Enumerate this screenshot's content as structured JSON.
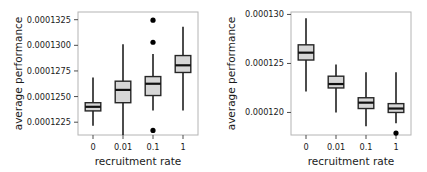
{
  "figure": {
    "title": "",
    "panel_count": 2
  },
  "chart_data": [
    {
      "type": "box",
      "panel_id": "left",
      "panel_label": "left-panel",
      "title": "",
      "xlabel": "recruitment rate",
      "ylabel": "average performance",
      "categories": [
        "0",
        "0.01",
        "0.1",
        "1"
      ],
      "ylim": [
        0.00012125,
        0.00013325
      ],
      "yticks": [
        0.0001225,
        0.000125,
        0.0001275,
        0.00013,
        0.0001325
      ],
      "ytick_labels": [
        "0.0001225",
        "0.0001250",
        "0.0001275",
        "0.0001300",
        "0.0001325"
      ],
      "grid": false,
      "legend": null,
      "boxes": [
        {
          "category": "0",
          "whisker_low": 0.00012215,
          "q1": 0.0001236,
          "median": 0.000124,
          "q3": 0.0001244,
          "whisker_high": 0.00012685,
          "outliers": []
        },
        {
          "category": "0.01",
          "whisker_low": 0.00012125,
          "q1": 0.0001244,
          "median": 0.00012565,
          "q3": 0.0001265,
          "whisker_high": 0.0001301,
          "outliers": []
        },
        {
          "category": "0.1",
          "whisker_low": 0.00012365,
          "q1": 0.0001251,
          "median": 0.00012625,
          "q3": 0.00012695,
          "whisker_high": 0.00012915,
          "outliers": [
            0.00013245,
            0.0001303,
            0.0001217
          ]
        },
        {
          "category": "1",
          "whisker_low": 0.00012365,
          "q1": 0.00012735,
          "median": 0.00012805,
          "q3": 0.000129,
          "whisker_high": 0.0001318,
          "outliers": []
        }
      ]
    },
    {
      "type": "box",
      "panel_id": "right",
      "panel_label": "right-panel",
      "title": "",
      "xlabel": "recruitment rate",
      "ylabel": "average performance",
      "categories": [
        "0",
        "0.01",
        "0.1",
        "1"
      ],
      "ylim": [
        0.0001177,
        0.00013025
      ],
      "yticks": [
        0.00012,
        0.000125,
        0.00013
      ],
      "ytick_labels": [
        "0.000120",
        "0.000125",
        "0.000130"
      ],
      "grid": false,
      "legend": null,
      "boxes": [
        {
          "category": "0",
          "whisker_low": 0.00012215,
          "q1": 0.00012535,
          "median": 0.0001261,
          "q3": 0.0001269,
          "whisker_high": 0.0001296,
          "outliers": []
        },
        {
          "category": "0.01",
          "whisker_low": 0.00012,
          "q1": 0.0001225,
          "median": 0.0001229,
          "q3": 0.0001237,
          "whisker_high": 0.0001249,
          "outliers": []
        },
        {
          "category": "0.1",
          "whisker_low": 0.0001186,
          "q1": 0.0001204,
          "median": 0.000121,
          "q3": 0.0001215,
          "whisker_high": 0.0001241,
          "outliers": []
        },
        {
          "category": "1",
          "whisker_low": 0.0001189,
          "q1": 0.00012,
          "median": 0.0001204,
          "q3": 0.0001209,
          "whisker_high": 0.0001241,
          "outliers": [
            0.0001179
          ]
        }
      ]
    }
  ],
  "colors": {
    "box_fill": "#d6d6d6",
    "box_stroke": "#262626",
    "median": "#111111",
    "whisker": "#111111",
    "outlier": "#000000",
    "frame": "#b4b4b4",
    "text": "#1a1a1a",
    "background": "#ffffff"
  }
}
